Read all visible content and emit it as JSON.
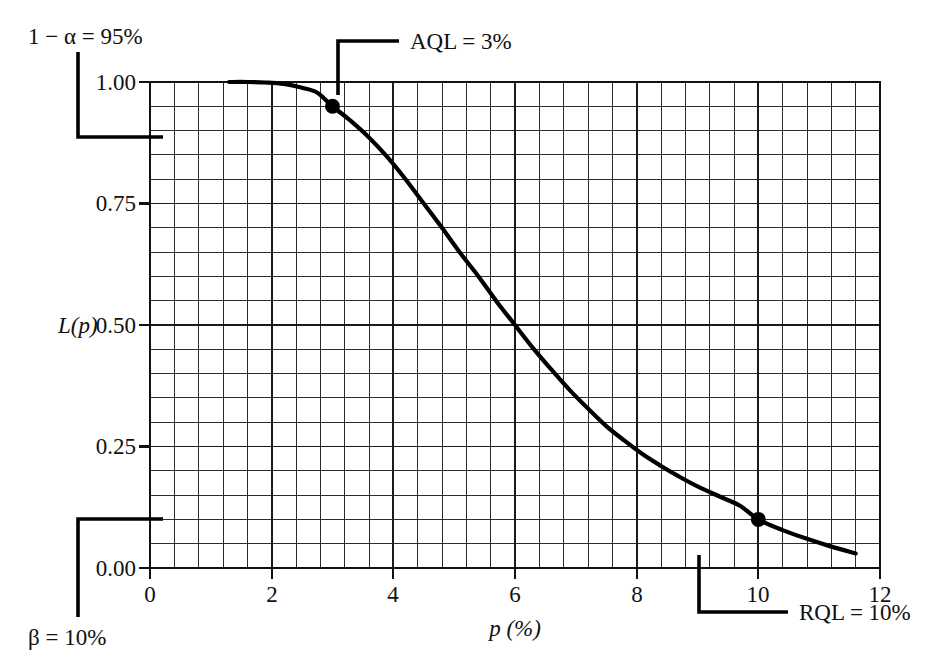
{
  "chart_data": {
    "type": "line",
    "title": "",
    "subtitle": "",
    "xlabel": "p (%)",
    "ylabel": "L(p)",
    "xlim": [
      0,
      12
    ],
    "ylim": [
      0.0,
      1.0
    ],
    "grid": true,
    "grid_minor_x_step": 0.4,
    "grid_minor_y_step": 0.05,
    "legend": "none",
    "x_ticks": [
      0,
      2,
      4,
      6,
      8,
      10,
      12
    ],
    "x_tick_labels": [
      "0",
      "2",
      "4",
      "6",
      "8",
      "10",
      "12"
    ],
    "y_ticks": [
      0.0,
      0.25,
      0.5,
      0.75,
      1.0
    ],
    "y_tick_labels": [
      "0.00",
      "0.25",
      "0.50",
      "0.75",
      "1.00"
    ],
    "series": [
      {
        "name": "OC curve",
        "x": [
          1.3,
          1.6,
          1.9,
          2.2,
          2.5,
          2.75,
          3.0,
          3.3,
          3.6,
          3.9,
          4.2,
          4.5,
          4.8,
          5.1,
          5.4,
          5.7,
          6.0,
          6.3,
          6.6,
          6.9,
          7.2,
          7.5,
          7.8,
          8.1,
          8.4,
          8.7,
          9.0,
          9.4,
          9.7,
          10.0,
          10.4,
          10.8,
          11.2,
          11.6
        ],
        "y": [
          1.0,
          1.0,
          0.999,
          0.996,
          0.988,
          0.978,
          0.95,
          0.92,
          0.886,
          0.846,
          0.8,
          0.75,
          0.7,
          0.648,
          0.6,
          0.548,
          0.5,
          0.452,
          0.408,
          0.366,
          0.328,
          0.292,
          0.262,
          0.234,
          0.21,
          0.188,
          0.168,
          0.145,
          0.128,
          0.1,
          0.078,
          0.06,
          0.044,
          0.03
        ]
      }
    ],
    "markers": [
      {
        "label": "AQL point",
        "x": 3,
        "y": 0.95
      },
      {
        "label": "RQL point",
        "x": 10,
        "y": 0.1
      }
    ],
    "annotations": [
      {
        "id": "alpha",
        "text": "1 − α = 95%",
        "points_to_y": 0.95,
        "position": "upper-left"
      },
      {
        "id": "aql",
        "text": "AQL = 3%",
        "points_to_x": 3,
        "position": "top"
      },
      {
        "id": "beta",
        "text": "β = 10%",
        "points_to_y": 0.1,
        "position": "lower-left"
      },
      {
        "id": "rql",
        "text": "RQL = 10%",
        "points_to_x": 10,
        "position": "bottom"
      }
    ]
  },
  "labels": {
    "y_axis_title": "L(p)",
    "x_axis_title": "p (%)",
    "y_tick_1_00": "1.00",
    "y_tick_0_75": "0.75",
    "y_tick_0_50": "0.50",
    "y_tick_0_25": "0.25",
    "y_tick_0_00": "0.00",
    "x_tick_0": "0",
    "x_tick_2": "2",
    "x_tick_4": "4",
    "x_tick_6": "6",
    "x_tick_8": "8",
    "x_tick_10": "10",
    "x_tick_12": "12"
  },
  "annotations": {
    "alpha_text": "1 − α = 95%",
    "aql_text": "AQL = 3%",
    "beta_text": "β = 10%",
    "rql_text": "RQL = 10%"
  },
  "colors": {
    "background": "#ffffff",
    "ink": "#111111",
    "curve": "#000000",
    "grid_minor": "#2b2b2b",
    "grid_major": "#1a1a1a"
  }
}
